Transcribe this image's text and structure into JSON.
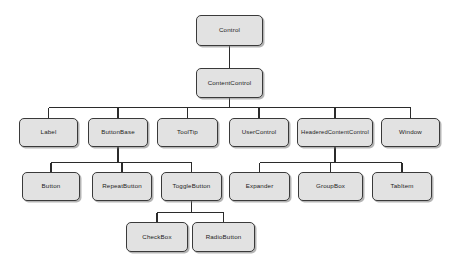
{
  "diagram": {
    "type": "tree",
    "orientation": "top-down",
    "colors": {
      "node_fill": "#e2e2e2",
      "node_border": "#3a3a3a",
      "edge": "#2b2b2b",
      "background": "#ffffff",
      "text": "#1c1c1c"
    },
    "nodes": [
      {
        "id": "control",
        "label": "Control",
        "x": 196,
        "y": 15,
        "w": 67,
        "h": 31,
        "level": 0
      },
      {
        "id": "contentcontrol",
        "label": "ContentControl",
        "x": 196,
        "y": 68,
        "w": 67,
        "h": 30,
        "level": 1
      },
      {
        "id": "label",
        "label": "Label",
        "x": 19,
        "y": 118,
        "w": 59,
        "h": 29,
        "level": 2
      },
      {
        "id": "buttonbase",
        "label": "ButtonBase",
        "x": 88,
        "y": 118,
        "w": 60,
        "h": 29,
        "level": 2
      },
      {
        "id": "tooltip",
        "label": "ToolTip",
        "x": 157,
        "y": 118,
        "w": 61,
        "h": 29,
        "level": 2
      },
      {
        "id": "usercontrol",
        "label": "UserControl",
        "x": 229,
        "y": 118,
        "w": 60,
        "h": 29,
        "level": 2
      },
      {
        "id": "headeredcontentcontrol",
        "label": "HeaderedContentControl",
        "x": 297,
        "y": 118,
        "w": 76,
        "h": 29,
        "level": 2
      },
      {
        "id": "window",
        "label": "Window",
        "x": 381,
        "y": 118,
        "w": 59,
        "h": 29,
        "level": 2
      },
      {
        "id": "button",
        "label": "Button",
        "x": 22,
        "y": 172,
        "w": 58,
        "h": 29,
        "level": 3
      },
      {
        "id": "repeatbutton",
        "label": "RepeatButton",
        "x": 92,
        "y": 172,
        "w": 60,
        "h": 29,
        "level": 3
      },
      {
        "id": "togglebutton",
        "label": "ToggleButton",
        "x": 161,
        "y": 172,
        "w": 61,
        "h": 29,
        "level": 3
      },
      {
        "id": "expander",
        "label": "Expander",
        "x": 229,
        "y": 172,
        "w": 61,
        "h": 29,
        "level": 3
      },
      {
        "id": "groupbox",
        "label": "GroupBox",
        "x": 298,
        "y": 172,
        "w": 65,
        "h": 29,
        "level": 3
      },
      {
        "id": "tabitem",
        "label": "TabItem",
        "x": 372,
        "y": 172,
        "w": 60,
        "h": 29,
        "level": 3
      },
      {
        "id": "checkbox",
        "label": "CheckBox",
        "x": 126,
        "y": 222,
        "w": 62,
        "h": 30,
        "level": 4
      },
      {
        "id": "radiobutton",
        "label": "RadioButton",
        "x": 192,
        "y": 222,
        "w": 63,
        "h": 30,
        "level": 4
      }
    ],
    "edges": [
      {
        "from": "control",
        "to": "contentcontrol"
      },
      {
        "from": "contentcontrol",
        "to": "label"
      },
      {
        "from": "contentcontrol",
        "to": "buttonbase"
      },
      {
        "from": "contentcontrol",
        "to": "tooltip"
      },
      {
        "from": "contentcontrol",
        "to": "usercontrol"
      },
      {
        "from": "contentcontrol",
        "to": "headeredcontentcontrol"
      },
      {
        "from": "contentcontrol",
        "to": "window"
      },
      {
        "from": "buttonbase",
        "to": "button"
      },
      {
        "from": "buttonbase",
        "to": "repeatbutton"
      },
      {
        "from": "buttonbase",
        "to": "togglebutton"
      },
      {
        "from": "headeredcontentcontrol",
        "to": "expander"
      },
      {
        "from": "headeredcontentcontrol",
        "to": "groupbox"
      },
      {
        "from": "headeredcontentcontrol",
        "to": "tabitem"
      },
      {
        "from": "togglebutton",
        "to": "checkbox"
      },
      {
        "from": "togglebutton",
        "to": "radiobutton"
      }
    ],
    "bus_rows": [
      {
        "parent": "contentcontrol",
        "y": 107.5
      },
      {
        "parent": "buttonbase",
        "y": 162.5
      },
      {
        "parent": "headeredcontentcontrol",
        "y": 162.5
      },
      {
        "parent": "togglebutton",
        "y": 212.5
      }
    ]
  }
}
